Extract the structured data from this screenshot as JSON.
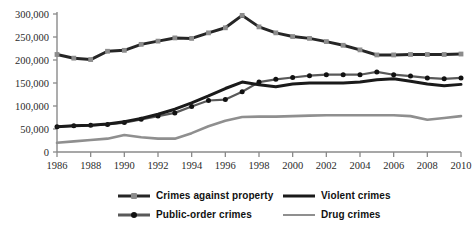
{
  "chart_data": {
    "type": "line",
    "title": "",
    "subtitle": "",
    "xlabel": "",
    "ylabel": "",
    "xlim": [
      1986,
      2010
    ],
    "ylim": [
      0,
      300000
    ],
    "grid": false,
    "legend_position": "bottom",
    "x": [
      1986,
      1987,
      1988,
      1989,
      1990,
      1991,
      1992,
      1993,
      1994,
      1995,
      1996,
      1997,
      1998,
      1999,
      2000,
      2001,
      2002,
      2003,
      2004,
      2005,
      2006,
      2007,
      2008,
      2009,
      2010
    ],
    "xticks": [
      1986,
      1988,
      1990,
      1992,
      1994,
      1996,
      1998,
      2000,
      2002,
      2004,
      2006,
      2008,
      2010
    ],
    "xtick_labels": [
      "1986",
      "1988",
      "1990",
      "1992",
      "1994",
      "1996",
      "1998",
      "2000",
      "2002",
      "2004",
      "2006",
      "2008",
      "2010"
    ],
    "yticks": [
      0,
      50000,
      100000,
      150000,
      200000,
      250000,
      300000
    ],
    "ytick_labels": [
      "0",
      "50,000",
      "100,000",
      "150,000",
      "200,000",
      "250,000",
      "300,000"
    ],
    "series": [
      {
        "name": "Crimes against property",
        "color": "#262626",
        "marker": "square",
        "marker_color": "#8c8c8c",
        "width": 3.0,
        "values": [
          212000,
          204000,
          201000,
          219000,
          221000,
          234000,
          241000,
          248000,
          247000,
          259000,
          270000,
          297000,
          272000,
          259000,
          251000,
          247000,
          240000,
          232000,
          222000,
          211000,
          211000,
          212000,
          212000,
          212000,
          213000
        ]
      },
      {
        "name": "Violent crimes",
        "color": "#1a1a1a",
        "marker": "none",
        "marker_color": "#1a1a1a",
        "width": 3.0,
        "values": [
          55000,
          57000,
          58000,
          61000,
          66000,
          73000,
          82000,
          93000,
          107000,
          122000,
          138000,
          152000,
          146000,
          142000,
          148000,
          150000,
          150000,
          150000,
          152000,
          157000,
          159000,
          154000,
          148000,
          144000,
          147000
        ]
      },
      {
        "name": "Public-order crimes",
        "color": "#595959",
        "marker": "circle",
        "marker_color": "#111111",
        "width": 2.2,
        "values": [
          55000,
          57000,
          58000,
          60000,
          64000,
          71000,
          78000,
          85000,
          99000,
          112000,
          114000,
          131000,
          152000,
          158000,
          162000,
          166000,
          168000,
          168000,
          168000,
          174000,
          168000,
          165000,
          161000,
          159000,
          161000
        ]
      },
      {
        "name": "Drug crimes",
        "color": "#8f8f8f",
        "marker": "none",
        "marker_color": "#8f8f8f",
        "width": 2.6,
        "values": [
          20000,
          23000,
          26000,
          29000,
          37000,
          32000,
          29000,
          29000,
          41000,
          56000,
          68000,
          76000,
          77000,
          77000,
          78000,
          79000,
          80000,
          80000,
          80000,
          80000,
          80000,
          78000,
          70000,
          74000,
          78000
        ]
      }
    ]
  },
  "legend": {
    "entries": [
      {
        "label": "Crimes against property"
      },
      {
        "label": "Violent crimes"
      },
      {
        "label": "Public-order crimes"
      },
      {
        "label": "Drug crimes"
      }
    ]
  },
  "caption": {
    "text": ""
  }
}
